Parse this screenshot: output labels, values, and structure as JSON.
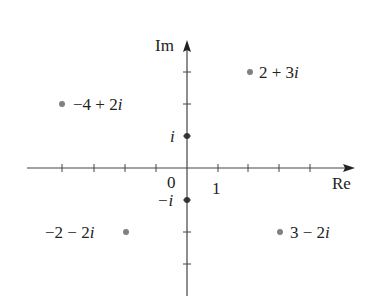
{
  "diagram": {
    "axes": {
      "real_label": "Re",
      "imag_label": "Im",
      "origin_label": "0",
      "unit_real_label": "1",
      "unit_imag_label": "i",
      "neg_unit_imag_label": "−i"
    },
    "points": [
      {
        "label": "2 + 3i",
        "re": 2,
        "im": 3
      },
      {
        "label": "−4 + 2i",
        "re": -4,
        "im": 2
      },
      {
        "label": "−2 − 2i",
        "re": -2,
        "im": -2
      },
      {
        "label": "3 − 2i",
        "re": 3,
        "im": -2
      }
    ],
    "colors": {
      "axis": "#444444",
      "point": "#808080",
      "axis_point": "#333333"
    }
  }
}
